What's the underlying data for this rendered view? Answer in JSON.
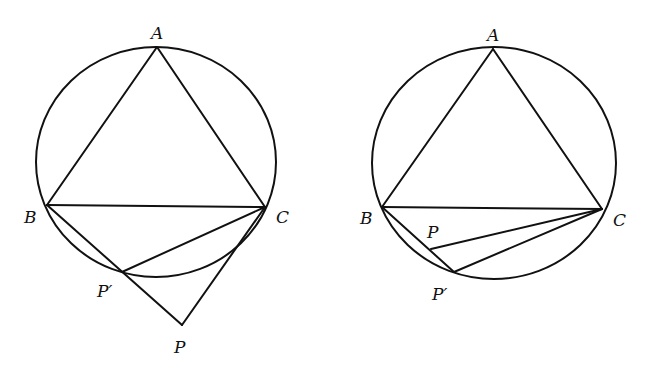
{
  "figures": [
    {
      "name": "left-figure",
      "circle": {
        "cx": 156,
        "cy": 162,
        "rx": 120,
        "ry": 115
      },
      "points": {
        "A": {
          "label": "A",
          "x": 157,
          "y": 47,
          "lx": 151,
          "ly": 39
        },
        "B": {
          "label": "B",
          "x": 47,
          "y": 205,
          "lx": 24,
          "ly": 223
        },
        "C": {
          "label": "C",
          "x": 265,
          "y": 207,
          "lx": 276,
          "ly": 223
        },
        "Pp": {
          "label": "P′",
          "x": 122,
          "y": 272,
          "lx": 97,
          "ly": 297
        },
        "P": {
          "label": "P",
          "x": 182,
          "y": 325,
          "lx": 174,
          "ly": 353
        }
      },
      "segments": [
        [
          "A",
          "B"
        ],
        [
          "A",
          "C"
        ],
        [
          "B",
          "C"
        ],
        [
          "B",
          "P"
        ],
        [
          "C",
          "P"
        ],
        [
          "C",
          "Pp"
        ]
      ]
    },
    {
      "name": "right-figure",
      "circle": {
        "cx": 494,
        "cy": 163,
        "rx": 122,
        "ry": 116
      },
      "points": {
        "A": {
          "label": "A",
          "x": 493,
          "y": 49,
          "lx": 487,
          "ly": 41
        },
        "B": {
          "label": "B",
          "x": 382,
          "y": 207,
          "lx": 360,
          "ly": 224
        },
        "C": {
          "label": "C",
          "x": 602,
          "y": 209,
          "lx": 613,
          "ly": 226
        },
        "P": {
          "label": "P",
          "x": 431,
          "y": 249,
          "lx": 427,
          "ly": 238
        },
        "Pp": {
          "label": "P′",
          "x": 454,
          "y": 272,
          "lx": 432,
          "ly": 300
        }
      },
      "segments": [
        [
          "A",
          "B"
        ],
        [
          "A",
          "C"
        ],
        [
          "B",
          "C"
        ],
        [
          "B",
          "Pp"
        ],
        [
          "C",
          "P"
        ],
        [
          "C",
          "Pp"
        ]
      ]
    }
  ],
  "colors": {
    "stroke": "#111111",
    "background": "#ffffff"
  }
}
